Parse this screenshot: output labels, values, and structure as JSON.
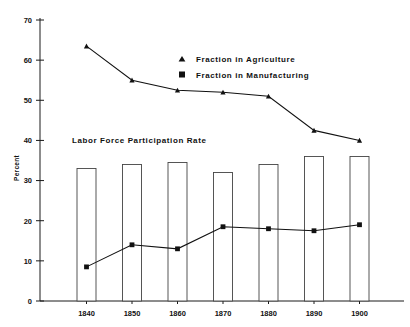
{
  "chart_data": {
    "type": "bar",
    "title": "",
    "xlabel": "",
    "ylabel": "Percent",
    "ylim": [
      0,
      70
    ],
    "yticks": [
      0,
      10,
      20,
      30,
      40,
      50,
      60,
      70
    ],
    "ytick_labels": [
      "0",
      "10",
      "20",
      "30",
      "40",
      "50",
      "60",
      "70"
    ],
    "categories": [
      "1840",
      "1850",
      "1860",
      "1870",
      "1880",
      "1890",
      "1900"
    ],
    "grid": false,
    "legend_position": "upper-center",
    "annotations": [
      {
        "text": "Labor Force Participation Rate",
        "refers_to": "bars"
      }
    ],
    "series": [
      {
        "name": "Labor Force Participation Rate",
        "kind": "bar",
        "marker": "none",
        "values": [
          33,
          34,
          34.5,
          32,
          34,
          36,
          36
        ]
      },
      {
        "name": "Fraction in Agriculture",
        "kind": "line",
        "marker": "triangle",
        "values": [
          63.5,
          55,
          52.5,
          52,
          51,
          42.5,
          40
        ]
      },
      {
        "name": "Fraction in Manufacturing",
        "kind": "line",
        "marker": "square",
        "values": [
          8.5,
          14,
          13,
          18.5,
          18,
          17.5,
          19
        ]
      }
    ]
  },
  "legend": {
    "items": [
      {
        "label": "Fraction in Agriculture",
        "marker": "triangle"
      },
      {
        "label": "Fraction in Manufacturing",
        "marker": "square"
      }
    ]
  },
  "axis": {
    "y_title": "Percent",
    "y_labels": [
      "70",
      "60",
      "50",
      "40",
      "30",
      "20",
      "10",
      "0"
    ],
    "x_labels": [
      "1840",
      "1850",
      "1860",
      "1870",
      "1880",
      "1890",
      "1900"
    ]
  },
  "bars_annotation": "Labor Force Participation Rate",
  "colors": {
    "axis": "#1a1a1a",
    "line": "#111111",
    "bar_stroke": "#444444",
    "bar_fill": "#ffffff",
    "background": "#ffffff"
  }
}
